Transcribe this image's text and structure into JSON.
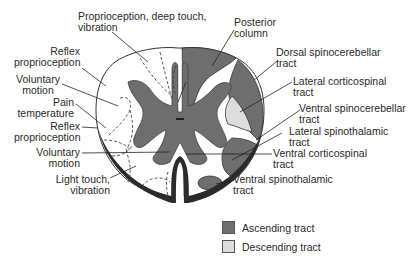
{
  "figure": {
    "type": "spinal-cord-cross-section",
    "colors": {
      "ascending": "#6e6e6e",
      "descending": "#dcdcdc",
      "gray_matter": "#6e6e6e",
      "pia_outline": "#2b2b2b",
      "white_matter": "#ffffff"
    }
  },
  "labels": {
    "left": [
      {
        "id": "prop-deep-touch",
        "line1": "Proprioception, deep touch,",
        "line2": "vibration"
      },
      {
        "id": "reflex-prop-upper",
        "line1": "Reflex",
        "line2": "proprioception"
      },
      {
        "id": "voluntary-upper",
        "line1": "Voluntary",
        "line2": "motion"
      },
      {
        "id": "pain-temp",
        "line1": "Pain",
        "line2": "temperature"
      },
      {
        "id": "reflex-prop-lower",
        "line1": "Reflex",
        "line2": "proprioception"
      },
      {
        "id": "voluntary-lower",
        "line1": "Voluntary",
        "line2": "motion"
      },
      {
        "id": "light-touch",
        "line1": "Light touch,",
        "line2": "vibration"
      }
    ],
    "right": [
      {
        "id": "posterior-column",
        "line1": "Posterior",
        "line2": "column"
      },
      {
        "id": "dorsal-spinocerebellar",
        "line1": "Dorsal spinocerebellar",
        "line2": "tract"
      },
      {
        "id": "lateral-corticospinal",
        "line1": "Lateral corticospinal",
        "line2": "tract"
      },
      {
        "id": "ventral-spinocerebellar",
        "line1": "Ventral spinocerebellar",
        "line2": "tract"
      },
      {
        "id": "lateral-spinothalamic",
        "line1": "Lateral spinothalamic",
        "line2": "tract"
      },
      {
        "id": "ventral-corticospinal",
        "line1": "Ventral corticospinal",
        "line2": "tract"
      },
      {
        "id": "ventral-spinothalamic",
        "line1": "Ventral spinothalamic",
        "line2": "tract"
      }
    ]
  },
  "legend": [
    {
      "label": "Ascending tract",
      "color": "#6e6e6e"
    },
    {
      "label": "Descending tract",
      "color": "#dcdcdc"
    }
  ]
}
